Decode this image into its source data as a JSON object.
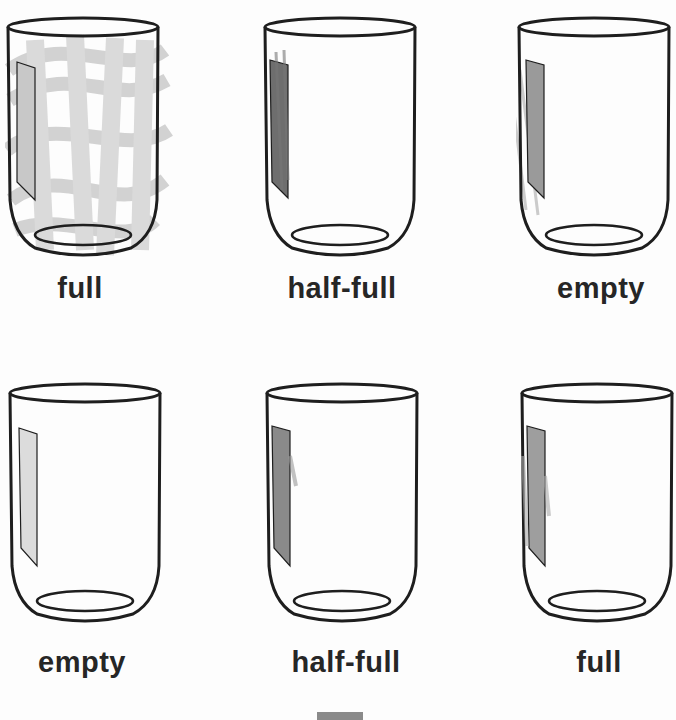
{
  "worksheet": {
    "rows": [
      {
        "items": [
          {
            "label": "full",
            "fill": "full",
            "highlight_shade": "#c8c8c8"
          },
          {
            "label": "half-full",
            "fill": "half-full",
            "highlight_shade": "#6e6e6e"
          },
          {
            "label": "empty",
            "fill": "empty",
            "highlight_shade": "#9a9a9a"
          }
        ]
      },
      {
        "items": [
          {
            "label": "empty",
            "fill": "empty",
            "highlight_shade": "#dcdcdc"
          },
          {
            "label": "half-full",
            "fill": "half-full",
            "highlight_shade": "#8a8a8a"
          },
          {
            "label": "full",
            "fill": "full",
            "highlight_shade": "#9e9e9e"
          }
        ]
      }
    ]
  },
  "colors": {
    "outline": "#1e1e1e",
    "scribble": "#c4c4c4",
    "background": "#fdfdfd"
  }
}
